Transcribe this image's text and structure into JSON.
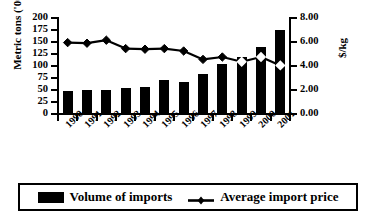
{
  "chart_data": {
    "type": "bar",
    "title": "",
    "categories": [
      "1990",
      "1991",
      "1992",
      "1993",
      "1994",
      "1995",
      "1996",
      "1997",
      "1998",
      "1999",
      "2000",
      "2001"
    ],
    "series": [
      {
        "name": "Volume of imports",
        "type": "bar",
        "axis": "left",
        "unit": "Metric tons ('000)",
        "color": "#000000",
        "values": [
          48,
          50,
          49,
          55,
          56,
          70,
          66,
          83,
          105,
          118,
          140,
          175
        ]
      },
      {
        "name": "Average import price",
        "type": "line",
        "axis": "right",
        "unit": "$/kg",
        "color": "#000000",
        "marker": "diamond",
        "values": [
          5.95,
          5.9,
          6.15,
          5.45,
          5.4,
          5.45,
          5.25,
          4.55,
          4.75,
          4.35,
          4.75,
          4.05
        ]
      }
    ],
    "xlabel": "",
    "ylabel": "Metric tons ('000)",
    "ylabel_secondary": "$/kg",
    "ylim": [
      0,
      200
    ],
    "ylim_secondary": [
      0,
      8
    ],
    "yticks": [
      "0",
      "25",
      "50",
      "75",
      "100",
      "125",
      "150",
      "175",
      "200"
    ],
    "yticks_secondary": [
      "0.00",
      "2.00",
      "4.00",
      "6.00",
      "8.00"
    ],
    "grid": false,
    "legend_position": "bottom"
  },
  "axes": {
    "left": {
      "title": "Metric tons ('000)",
      "ticks": [
        "200",
        "175",
        "150",
        "125",
        "100",
        "75",
        "50",
        "25",
        "0"
      ]
    },
    "right": {
      "title": "$/kg",
      "ticks": [
        "8.00",
        "6.00",
        "4.00",
        "2.00",
        "0.00"
      ]
    },
    "x": {
      "categories": [
        "1990",
        "1991",
        "1992",
        "1993",
        "1994",
        "1995",
        "1996",
        "1997",
        "1998",
        "1999",
        "2000",
        "2001"
      ]
    }
  },
  "legend": {
    "items": [
      {
        "label": "Volume of imports",
        "marker": "bar-swatch"
      },
      {
        "label": "Average import price",
        "marker": "diamond-line-swatch"
      }
    ]
  }
}
